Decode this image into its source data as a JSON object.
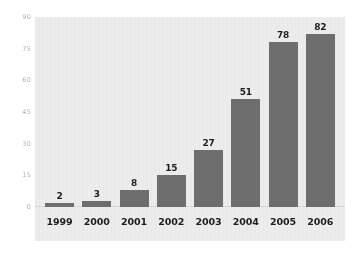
{
  "chart_data": {
    "type": "bar",
    "title": "",
    "subtitle": "",
    "xlabel": "",
    "ylabel": "",
    "categories": [
      "1999",
      "2000",
      "2001",
      "2002",
      "2003",
      "2004",
      "2005",
      "2006"
    ],
    "values": [
      2,
      3,
      8,
      15,
      27,
      51,
      78,
      82
    ],
    "value_labels": [
      "2",
      "3",
      "8",
      "15",
      "27",
      "51",
      "78",
      "82"
    ],
    "ylim": [
      0,
      90
    ],
    "yticks": [
      90,
      75,
      60,
      45,
      30,
      15,
      0
    ],
    "ytick_labels": [
      "90",
      "75",
      "60",
      "45",
      "30",
      "15",
      "0"
    ],
    "grid": false,
    "legend": null,
    "legend_position": "none",
    "orientation": "vertical",
    "bar_labels_position": "above",
    "colors": {
      "bar": "#6e6e6e",
      "plot_background": "#ececec",
      "figure_background": "#ffffff",
      "value_label": "#1d1d1d",
      "xtick_label": "#1d1d1d",
      "ytick_label": "#b3b3b3",
      "baseline": "#d6d6d6"
    }
  }
}
